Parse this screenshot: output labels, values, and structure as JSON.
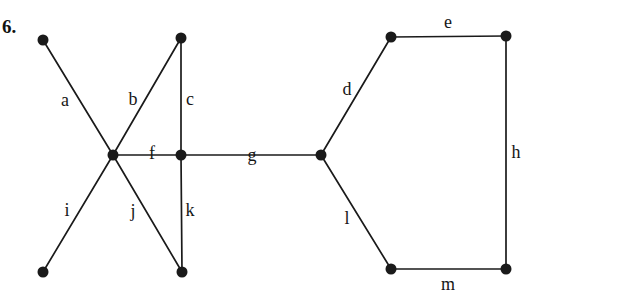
{
  "figure": {
    "problem_number": "6.",
    "background_color": "#ffffff",
    "stroke_color": "#1a1a1a",
    "width": 622,
    "height": 293
  },
  "graph": {
    "description": "Undirected graph with 11 vertices and 13 labeled edges",
    "vertices": [
      {
        "id": "v1",
        "name": "top-left",
        "x": 43,
        "y": 40
      },
      {
        "id": "v2",
        "name": "top-middle",
        "x": 181,
        "y": 38
      },
      {
        "id": "v3",
        "name": "left-hub",
        "x": 113,
        "y": 155
      },
      {
        "id": "v4",
        "name": "center",
        "x": 181,
        "y": 155
      },
      {
        "id": "v5",
        "name": "right-hub",
        "x": 321,
        "y": 155
      },
      {
        "id": "v6",
        "name": "bottom-left",
        "x": 43,
        "y": 272
      },
      {
        "id": "v7",
        "name": "bottom-middle",
        "x": 182,
        "y": 272
      },
      {
        "id": "v8",
        "name": "hexagon-top-left",
        "x": 391,
        "y": 37
      },
      {
        "id": "v9",
        "name": "hexagon-top-right",
        "x": 506,
        "y": 36
      },
      {
        "id": "v10",
        "name": "hexagon-bottom-left",
        "x": 391,
        "y": 269
      },
      {
        "id": "v11",
        "name": "hexagon-bottom-right",
        "x": 506,
        "y": 269
      }
    ],
    "vertex_radius": 5.5,
    "edges": [
      {
        "label": "a",
        "from": "v1",
        "to": "v3",
        "label_x": 65,
        "label_y": 100
      },
      {
        "label": "b",
        "from": "v3",
        "to": "v2",
        "label_x": 133,
        "label_y": 99
      },
      {
        "label": "c",
        "from": "v2",
        "to": "v4",
        "label_x": 190,
        "label_y": 99
      },
      {
        "label": "d",
        "from": "v5",
        "to": "v8",
        "label_x": 347,
        "label_y": 89
      },
      {
        "label": "e",
        "from": "v8",
        "to": "v9",
        "label_x": 448,
        "label_y": 22
      },
      {
        "label": "f",
        "from": "v3",
        "to": "v4",
        "label_x": 152,
        "label_y": 153
      },
      {
        "label": "g",
        "from": "v4",
        "to": "v5",
        "label_x": 252,
        "label_y": 155
      },
      {
        "label": "h",
        "from": "v9",
        "to": "v11",
        "label_x": 516,
        "label_y": 152
      },
      {
        "label": "i",
        "from": "v3",
        "to": "v6",
        "label_x": 67,
        "label_y": 210
      },
      {
        "label": "j",
        "from": "v3",
        "to": "v7",
        "label_x": 133,
        "label_y": 211
      },
      {
        "label": "k",
        "from": "v4",
        "to": "v7",
        "label_x": 190,
        "label_y": 210
      },
      {
        "label": "l",
        "from": "v5",
        "to": "v10",
        "label_x": 347,
        "label_y": 218
      },
      {
        "label": "m",
        "from": "v10",
        "to": "v11",
        "label_x": 448,
        "label_y": 284
      }
    ]
  }
}
